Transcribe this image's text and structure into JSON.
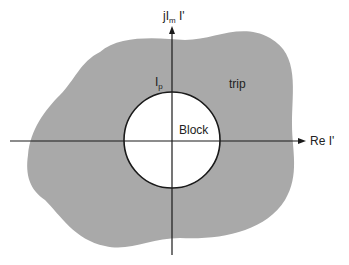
{
  "diagram": {
    "type": "complex-plane relay characteristic",
    "axes": {
      "vertical_label_main": "jI",
      "vertical_label_sub": "m",
      "vertical_label_suffix": " I'",
      "horizontal_label": "Re I'"
    },
    "regions": {
      "outer_label": "trip",
      "inner_label": "Block",
      "circle_label_main": "I",
      "circle_label_sub": "p"
    },
    "colors": {
      "trip_fill": "#a9a9a9",
      "block_fill": "#ffffff",
      "axis": "#1a1a1a",
      "circle_stroke": "#1a1a1a"
    }
  }
}
